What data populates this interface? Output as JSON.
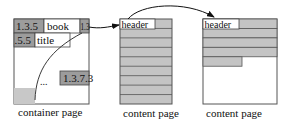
{
  "diagram": {
    "container_page": {
      "label": "container page",
      "cells": {
        "row1_left": "1.3.5",
        "row1_mid": "book",
        "row1_right": "1.3",
        "row2_left": ".5.5",
        "row2_mid": "title",
        "lower_right": "1.3.7.3",
        "ellipsis": "..."
      }
    },
    "content_page_1": {
      "label": "content page",
      "header": "header",
      "row_count": 9
    },
    "content_page_2": {
      "label": "content page",
      "header": "header",
      "full_rows": 4,
      "partial_rows": 1
    },
    "colors": {
      "dark_cell": "#9c9c9c",
      "light_cell": "#c8c8c8",
      "row_fill": "#c4c4c4",
      "border": "#444444",
      "page_border": "#555555"
    }
  }
}
